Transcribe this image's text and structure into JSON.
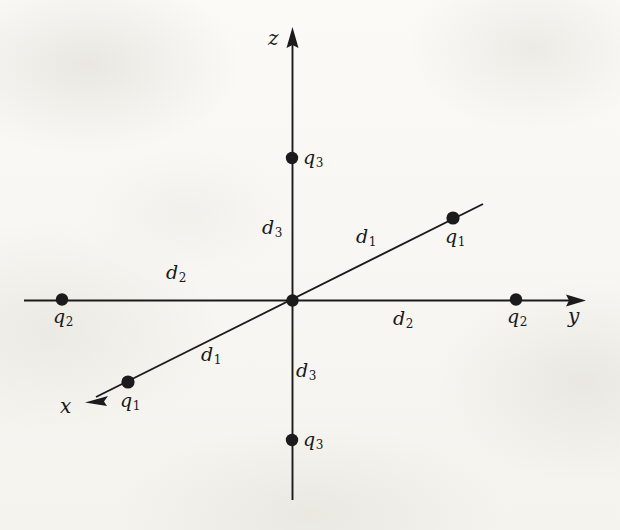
{
  "figure": {
    "kind": "3d-coordinate-axes-charge-diagram",
    "background_color": "#f7f6f2",
    "ink_color": "#1b1b1d",
    "axes": [
      {
        "name": "x",
        "label": "x",
        "direction": "down-left",
        "arrow": true
      },
      {
        "name": "y",
        "label": "y",
        "direction": "right",
        "arrow": true
      },
      {
        "name": "z",
        "label": "z",
        "direction": "up",
        "arrow": true
      }
    ],
    "origin": {
      "x": 292,
      "y": 301,
      "marked": true
    },
    "charges": [
      {
        "symbol": "q",
        "subscript": "3",
        "axis": "z",
        "side": "positive",
        "x": 292,
        "y": 158,
        "label_dx": 11,
        "label_dy": -10
      },
      {
        "symbol": "q",
        "subscript": "3",
        "axis": "z",
        "side": "negative",
        "x": 292,
        "y": 440,
        "label_dx": 11,
        "label_dy": -10
      },
      {
        "symbol": "q",
        "subscript": "2",
        "axis": "y",
        "side": "negative",
        "x": 62,
        "y": 299,
        "label_dx": -9,
        "label_dy": 8
      },
      {
        "symbol": "q",
        "subscript": "2",
        "axis": "y",
        "side": "positive",
        "x": 516,
        "y": 299,
        "label_dx": -9,
        "label_dy": 8
      },
      {
        "symbol": "q",
        "subscript": "1",
        "axis": "x",
        "side": "negative",
        "x": 453,
        "y": 218,
        "label_dx": -8,
        "label_dy": 9
      },
      {
        "symbol": "q",
        "subscript": "1",
        "axis": "x",
        "side": "positive",
        "x": 128,
        "y": 382,
        "label_dx": -8,
        "label_dy": 9
      }
    ],
    "distance_labels": [
      {
        "symbol": "d",
        "subscript": "3",
        "x": 270,
        "y": 228,
        "segment": "origin-to-positive-z"
      },
      {
        "symbol": "d",
        "subscript": "3",
        "x": 300,
        "y": 371,
        "segment": "origin-to-negative-z"
      },
      {
        "symbol": "d",
        "subscript": "2",
        "x": 170,
        "y": 272,
        "segment": "origin-to-negative-y"
      },
      {
        "symbol": "d",
        "subscript": "2",
        "x": 396,
        "y": 317,
        "segment": "origin-to-positive-y"
      },
      {
        "symbol": "d",
        "subscript": "1",
        "x": 360,
        "y": 236,
        "segment": "origin-to-negative-x"
      },
      {
        "symbol": "d",
        "subscript": "1",
        "x": 205,
        "y": 354,
        "segment": "origin-to-positive-x"
      }
    ],
    "axis_label_positions": {
      "x": {
        "x": 60,
        "y": 396
      },
      "y": {
        "x": 568,
        "y": 306
      },
      "z": {
        "x": 268,
        "y": 28
      }
    }
  }
}
